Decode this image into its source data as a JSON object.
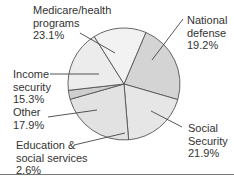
{
  "chart_data": {
    "type": "pie",
    "title": "",
    "categories": [
      "Medicare/health programs",
      "National defense",
      "Social Security",
      "Education & social services",
      "Other",
      "Income security"
    ],
    "values": [
      23.1,
      19.2,
      21.9,
      2.6,
      17.9,
      15.3
    ],
    "unit": "%",
    "start_angle_deg_clockwise_from_top": 23,
    "colors": [
      "#d4d4d4",
      "#e6e6e6",
      "#e2e2e2",
      "#cfcfcf",
      "#ececec",
      "#f2f2f2"
    ],
    "legend": "none (direct labels with leader lines)"
  },
  "labels": {
    "medicare": {
      "line1": "Medicare/health",
      "line2": "programs",
      "value": "23.1%"
    },
    "defense": {
      "line1": "National",
      "line2": "defense",
      "value": "19.2%"
    },
    "social_security": {
      "line1": "Social",
      "line2": "Security",
      "value": "21.9%"
    },
    "education": {
      "line1": "Education &",
      "line2": "social services",
      "value": "2.6%"
    },
    "other": {
      "line1": "Other",
      "value": "17.9%"
    },
    "income": {
      "line1": "Income",
      "line2": "security",
      "value": "15.3%"
    }
  }
}
